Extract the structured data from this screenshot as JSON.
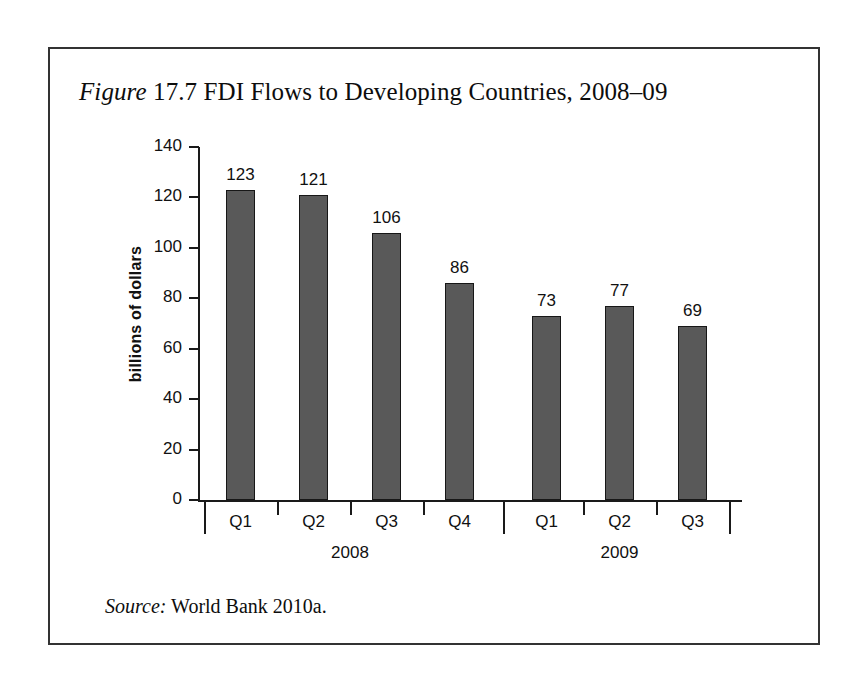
{
  "figure": {
    "title_prefix": "Figure",
    "title_rest": " 17.7 FDI Flows to Developing Countries, 2008–09",
    "source_prefix": "Source:",
    "source_rest": " World Bank 2010a."
  },
  "chart_data": {
    "type": "bar",
    "title": "Figure 17.7 FDI Flows to Developing Countries, 2008–09",
    "xlabel": "",
    "ylabel": "billions of dollars",
    "ylim": [
      0,
      140
    ],
    "ytick_labels": [
      "140",
      "120",
      "100",
      "80",
      "60",
      "40",
      "20",
      "0"
    ],
    "ytick_values": [
      140,
      120,
      100,
      80,
      60,
      40,
      20,
      0
    ],
    "grid": false,
    "legend": "none",
    "bar_color": "#595959",
    "bar_edge_color": "#171717",
    "categories": [
      "Q1",
      "Q2",
      "Q3",
      "Q4",
      "Q1",
      "Q2",
      "Q3"
    ],
    "values": [
      123,
      121,
      106,
      86,
      73,
      77,
      69
    ],
    "value_labels": [
      "123",
      "121",
      "106",
      "86",
      "73",
      "77",
      "69"
    ],
    "groups": [
      {
        "label": "2008",
        "categories": [
          "Q1",
          "Q2",
          "Q3",
          "Q4"
        ],
        "values": [
          123,
          121,
          106,
          86
        ]
      },
      {
        "label": "2009",
        "categories": [
          "Q1",
          "Q2",
          "Q3"
        ],
        "values": [
          73,
          77,
          69
        ]
      }
    ],
    "source": "Source: World Bank 2010a."
  }
}
